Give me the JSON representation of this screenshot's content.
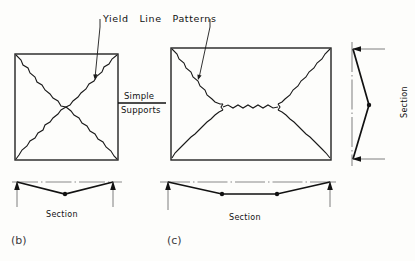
{
  "figure": {
    "title_words": [
      "Yield",
      "Line",
      "Patterns"
    ],
    "title_text": "Yield   Line   Patterns",
    "support_label_top": "Simple",
    "support_label_bottom": "Supports",
    "panels": [
      {
        "key": "b",
        "caption": "(b)",
        "plan_shape": "square",
        "section_label": "Section",
        "yield_pattern": "diagonal X from four corners to center",
        "interior_node_count": 1
      },
      {
        "key": "c",
        "caption": "(c)",
        "plan_shape": "rectangle",
        "section_label": "Section",
        "yield_pattern": "four corner fans to two interior nodes joined by a central ridge line",
        "interior_node_count": 2
      }
    ],
    "side_section": {
      "label": "Section",
      "orientation": "vertical",
      "interior_node_count": 1
    },
    "colors": {
      "background": "#fdfdfb",
      "ink": "#111111",
      "plan_outline": "#222222",
      "yield_line": "#1a1a1a",
      "datum_line": "#8a8a8a",
      "caption": "#3b3b3b"
    }
  }
}
